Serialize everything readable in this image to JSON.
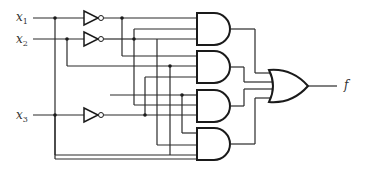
{
  "diagram": {
    "type": "logic-circuit",
    "inputs": [
      {
        "name": "x",
        "sub": "1"
      },
      {
        "name": "x",
        "sub": "2"
      },
      {
        "name": "x",
        "sub": "3"
      }
    ],
    "output": {
      "name": "f"
    },
    "gates": {
      "inverters": 3,
      "and_gates": 4,
      "or_gates": 1
    },
    "colors": {
      "line": "#1a1a1a",
      "background": "#ffffff"
    }
  }
}
